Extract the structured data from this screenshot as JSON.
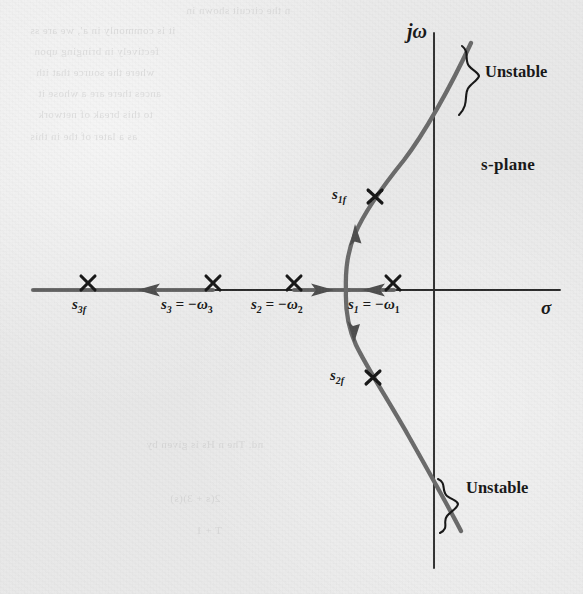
{
  "figure": {
    "kind": "root-locus-diagram",
    "plane_label": "s-plane",
    "axes": {
      "vertical_label": "jω",
      "horizontal_label": "σ",
      "origin_px": [
        434,
        290
      ],
      "vertical_extent_px": [
        33,
        568
      ],
      "horizontal_extent_px": [
        33,
        560
      ]
    },
    "annotations": {
      "unstable_top": "Unstable",
      "unstable_bottom": "Unstable",
      "plane": "s-plane"
    },
    "poles": [
      {
        "id": "s3f",
        "label_main": "s",
        "label_sub": "3f",
        "label_full": "s₃f",
        "x": 88,
        "y": 283,
        "on_axis": true,
        "marker": "x"
      },
      {
        "id": "s3",
        "label_main": "s",
        "label_sub": "3",
        "label_eq": "= −ω",
        "label_eq_sub": "3",
        "label_full": "s₃ = −ω₃",
        "x": 213,
        "y": 283,
        "on_axis": true,
        "marker": "x"
      },
      {
        "id": "s2",
        "label_main": "s",
        "label_sub": "2",
        "label_eq": "= −ω",
        "label_eq_sub": "2",
        "label_full": "s₂ = −ω₂",
        "x": 294,
        "y": 283,
        "on_axis": true,
        "marker": "x"
      },
      {
        "id": "s1",
        "label_main": "s",
        "label_sub": "1",
        "label_eq": "= −ω",
        "label_eq_sub": "1",
        "label_full": "s₁ = −ω₁",
        "x": 393,
        "y": 283,
        "on_axis": true,
        "marker": "x"
      },
      {
        "id": "s1f",
        "label_main": "s",
        "label_sub": "1f",
        "label_full": "s₁f",
        "x": 374,
        "y": 196,
        "on_axis": false,
        "marker": "x"
      },
      {
        "id": "s2f",
        "label_main": "s",
        "label_sub": "2f",
        "label_full": "s₂f",
        "x": 372,
        "y": 377,
        "on_axis": false,
        "marker": "x"
      }
    ],
    "pole_labels": [
      {
        "for": "s3f",
        "x": 72,
        "y": 296,
        "main": "s",
        "sub": "3f"
      },
      {
        "for": "s3",
        "x": 161,
        "y": 296,
        "main": "s",
        "sub": "3",
        "tail": "= −ω",
        "tail_sub": "3"
      },
      {
        "for": "s2",
        "x": 251,
        "y": 296,
        "main": "s",
        "sub": "2",
        "tail": "= −ω",
        "tail_sub": "2"
      },
      {
        "for": "s1",
        "x": 348,
        "y": 296,
        "main": "s",
        "sub": "1",
        "tail": "= −ω",
        "tail_sub": "1"
      },
      {
        "for": "s1f",
        "x": 332,
        "y": 186,
        "main": "s",
        "sub": "1f"
      },
      {
        "for": "s2f",
        "x": 330,
        "y": 367,
        "main": "s",
        "sub": "2f"
      }
    ],
    "loci": {
      "real_axis_segments": [
        {
          "from_px": [
            33,
            290
          ],
          "to_px": [
            213,
            290
          ],
          "arrow_at_px": [
            150,
            290
          ],
          "arrow_dir": "left"
        },
        {
          "from_px": [
            213,
            290
          ],
          "to_px": [
            294,
            290
          ],
          "arrow": "none"
        },
        {
          "from_px": [
            294,
            290
          ],
          "to_px": [
            348,
            290
          ],
          "arrow_at_px": [
            320,
            290
          ],
          "arrow_dir": "right"
        },
        {
          "from_px": [
            393,
            290
          ],
          "to_px": [
            348,
            290
          ],
          "arrow_at_px": [
            371,
            290
          ],
          "arrow_dir": "left"
        }
      ],
      "upper_branch": {
        "breakaway_px": [
          348,
          290
        ],
        "jw_crossing_px": [
          434,
          140
        ],
        "end_px": [
          471,
          43
        ],
        "arrow_at_px": [
          356,
          235
        ],
        "arrow_dir": "up"
      },
      "lower_branch": {
        "breakaway_px": [
          348,
          290
        ],
        "jw_crossing_px": [
          434,
          474
        ],
        "end_px": [
          461,
          531
        ],
        "arrow_at_px": [
          356,
          325
        ],
        "arrow_dir": "down"
      }
    },
    "braces": [
      {
        "id": "brace-unstable-top",
        "for": "unstable_top",
        "x": 455,
        "y_top": 48,
        "y_bottom": 118,
        "label_x": 484,
        "label_y": 72
      },
      {
        "id": "brace-unstable-bottom",
        "for": "unstable_bottom",
        "x": 444,
        "y_top": 478,
        "y_bottom": 530,
        "label_x": 468,
        "label_y": 487
      }
    ],
    "plane_label_pos": {
      "x": 482,
      "y": 164
    },
    "axis_label_pos": {
      "jw": {
        "x": 409,
        "y": 22
      },
      "sigma": {
        "x": 541,
        "y": 300
      }
    },
    "colors": {
      "paper": "#e9e9e9",
      "ink": "#1b1b1b",
      "locus": "#5a5a5a",
      "axis": "#2a2a2a",
      "ghost": "#bdbdbd"
    }
  },
  "bleed_through": [
    {
      "text": "n the circuit shown in",
      "x": 186,
      "y": 4,
      "size": 11
    },
    {
      "text": "it is commonly in a', we are ss",
      "x": 30,
      "y": 24,
      "size": 11
    },
    {
      "text": "fectively in bringing upon",
      "x": 34,
      "y": 45,
      "size": 11
    },
    {
      "text": "where the source that ith",
      "x": 36,
      "y": 66,
      "size": 11
    },
    {
      "text": "ances there are a whose it",
      "x": 38,
      "y": 87,
      "size": 11
    },
    {
      "text": "to this break of network",
      "x": 38,
      "y": 108,
      "size": 11
    },
    {
      "text": "as a later of the in this",
      "x": 30,
      "y": 130,
      "size": 11
    },
    {
      "text": "nd. The n Hs is given by",
      "x": 146,
      "y": 438,
      "size": 11
    },
    {
      "text": "2(s + 3)(s)",
      "x": 170,
      "y": 492,
      "size": 11
    },
    {
      "text": "T + 1",
      "x": 196,
      "y": 524,
      "size": 11
    }
  ]
}
